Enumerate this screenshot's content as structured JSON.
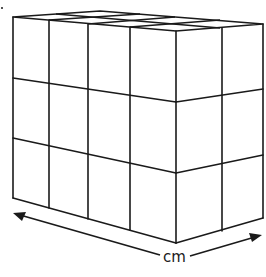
{
  "figure": {
    "type": "cuboid-of-unit-cubes",
    "front_face": {
      "columns": 4,
      "rows": 3
    },
    "side_face": {
      "columns": 2,
      "rows": 3
    },
    "top_face": {
      "columns": 4,
      "rows": 2
    },
    "stroke_color": "#1a1a1a",
    "background_color": "#ffffff"
  },
  "dimension_arrow": {
    "label": "cm",
    "direction": "along front and side bottom edges"
  }
}
